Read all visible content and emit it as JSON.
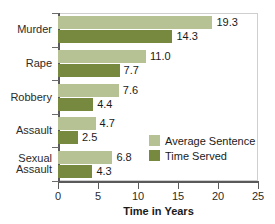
{
  "chart_data": {
    "type": "bar",
    "orientation": "horizontal",
    "title": "",
    "xlabel": "Time in Years",
    "ylabel": "",
    "xlim": [
      0,
      25
    ],
    "xticks": [
      0,
      5,
      10,
      15,
      20,
      25
    ],
    "grid": false,
    "legend_position": "inside-bottom-right",
    "categories": [
      "Murder",
      "Rape",
      "Robbery",
      "Assault",
      "Sexual Assault"
    ],
    "category_lines": [
      [
        "Murder"
      ],
      [
        "Rape"
      ],
      [
        "Robbery"
      ],
      [
        "Assault"
      ],
      [
        "Sexual",
        "Assault"
      ]
    ],
    "series": [
      {
        "name": "Average Sentence",
        "color": "#b6c294",
        "values": [
          19.3,
          11.0,
          7.6,
          4.7,
          6.8
        ],
        "labels": [
          "19.3",
          "11.0",
          "7.6",
          "4.7",
          "6.8"
        ]
      },
      {
        "name": "Time Served",
        "color": "#77883f",
        "values": [
          14.3,
          7.7,
          4.4,
          2.5,
          4.3
        ],
        "labels": [
          "14.3",
          "7.7",
          "4.4",
          "2.5",
          "4.3"
        ]
      }
    ]
  },
  "legend": {
    "items": [
      {
        "label": "Average Sentence",
        "color": "#b6c294"
      },
      {
        "label": "Time Served",
        "color": "#77883f"
      }
    ]
  },
  "axis": {
    "x_title": "Time in Years",
    "tick_labels": [
      "0",
      "5",
      "10",
      "15",
      "20",
      "25"
    ]
  }
}
